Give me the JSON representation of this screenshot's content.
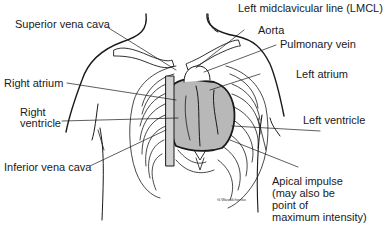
{
  "diagram": {
    "labels": {
      "lmcl": "Left midclavicular line (LMCL)",
      "superior_vena_cava": "Superior vena cava",
      "aorta": "Aorta",
      "pulmonary_vein": "Pulmonary vein",
      "right_atrium": "Right atrium",
      "left_atrium": "Left atrium",
      "right_ventricle_1": "Right",
      "right_ventricle_2": "ventricle",
      "left_ventricle": "Left ventricle",
      "inferior_vena_cava": "Inferior vena cava",
      "apical_1": "Apical impulse",
      "apical_2": "(may also be",
      "apical_3": "point of",
      "apical_4": "maximum intensity)"
    },
    "signature": "G.Wassilchenko",
    "colors": {
      "line": "#1a1a1a",
      "heart_fill": "#b8b8b8",
      "background": "#ffffff"
    }
  }
}
